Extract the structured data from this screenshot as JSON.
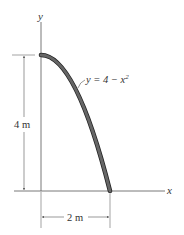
{
  "diagram": {
    "axes": {
      "x_label": "x",
      "y_label": "y"
    },
    "curve": {
      "equation_prefix": "y = 4 − x",
      "equation_exponent": "2",
      "stroke_color": "#555555",
      "outline_color": "#222222"
    },
    "dimensions": {
      "height_label": "4 m",
      "width_label": "2 m"
    },
    "colors": {
      "line": "#444444",
      "dim_line": "#666666"
    }
  }
}
